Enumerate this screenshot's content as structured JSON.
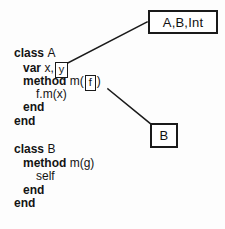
{
  "diagram": {
    "background_color": "#fdfdfd",
    "ink_color": "#1a1a1a"
  },
  "type_boxes": [
    {
      "id": "abint",
      "label": "A,B,Int"
    },
    {
      "id": "b",
      "label": "B"
    }
  ],
  "inline_boxes": [
    {
      "id": "y",
      "label": "y"
    },
    {
      "id": "f",
      "label": "f"
    }
  ],
  "edges": [
    {
      "from": "inline-box-y",
      "to": "type-box-abint",
      "x1": 63,
      "y1": 64,
      "x2": 147,
      "y2": 22
    },
    {
      "from": "inline-box-f",
      "to": "type-box-b",
      "x1": 108,
      "y1": 89,
      "x2": 151,
      "y2": 124
    }
  ],
  "class_a": {
    "header_keyword": "class",
    "header_name": "A",
    "var_keyword": "var",
    "var_names": "x,",
    "var_boxed": "y",
    "method_keyword": "method",
    "method_sig_open": "m(",
    "method_param_boxed": "f",
    "method_sig_close": ")",
    "body": "f.m(x)",
    "end_inner": "end",
    "end_outer": "end"
  },
  "class_b": {
    "header_keyword": "class",
    "header_name": "B",
    "method_keyword": "method",
    "method_sig": "m(g)",
    "body": "self",
    "end_inner": "end",
    "end_outer": "end"
  }
}
